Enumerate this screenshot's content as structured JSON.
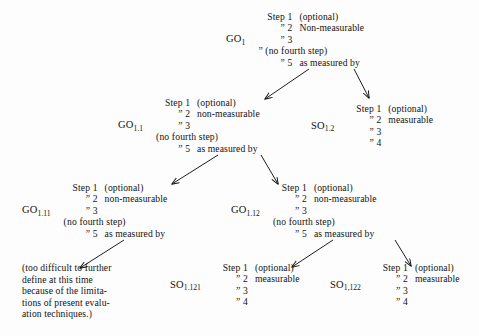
{
  "diagram": {
    "ink_color": "#111111",
    "background_color": "#fdfdfd",
    "nodes": [
      {
        "id": "GO1",
        "label_main": "GO",
        "label_sub": "1",
        "rows": [
          {
            "key": "Step 1",
            "value": "(optional)"
          },
          {
            "key": "” 2",
            "value": "Non-measurable"
          },
          {
            "key": "” 3",
            "value": ""
          },
          {
            "key": "” (no fourth step)",
            "value": ""
          },
          {
            "key": "” 5",
            "value": "as measured by"
          }
        ]
      },
      {
        "id": "GO1.1",
        "label_main": "GO",
        "label_sub": "1.1",
        "rows": [
          {
            "key": "Step 1",
            "value": "(optional)"
          },
          {
            "key": "” 2",
            "value": "non-measurable"
          },
          {
            "key": "” 3",
            "value": ""
          },
          {
            "key": "(no fourth step)",
            "value": ""
          },
          {
            "key": "” 5",
            "value": "as measured by"
          }
        ]
      },
      {
        "id": "SO1.2",
        "label_main": "SO",
        "label_sub": "1.2",
        "rows": [
          {
            "key": "Step 1",
            "value": "(optional)"
          },
          {
            "key": "” 2",
            "value": "measurable"
          },
          {
            "key": "” 3",
            "value": ""
          },
          {
            "key": "” 4",
            "value": ""
          }
        ]
      },
      {
        "id": "GO1.11",
        "label_main": "GO",
        "label_sub": "1.11",
        "rows": [
          {
            "key": "Step 1",
            "value": "(optional)"
          },
          {
            "key": "” 2",
            "value": "non-measurable"
          },
          {
            "key": "” 3",
            "value": ""
          },
          {
            "key": "(no fourth step)",
            "value": ""
          },
          {
            "key": "” 5",
            "value": "as measured by"
          }
        ]
      },
      {
        "id": "GO1.12",
        "label_main": "GO",
        "label_sub": "1.12",
        "rows": [
          {
            "key": "Step 1",
            "value": "(optional)"
          },
          {
            "key": "” 2",
            "value": "non-measurable"
          },
          {
            "key": "” 3",
            "value": ""
          },
          {
            "key": "(no fourth step)",
            "value": ""
          },
          {
            "key": "” 5",
            "value": "as measured by"
          }
        ]
      },
      {
        "id": "SO1.121",
        "label_main": "SO",
        "label_sub": "1.121",
        "rows": [
          {
            "key": "Step 1",
            "value": "(optional)"
          },
          {
            "key": "” 2",
            "value": "measurable"
          },
          {
            "key": "” 3",
            "value": ""
          },
          {
            "key": "” 4",
            "value": ""
          }
        ]
      },
      {
        "id": "SO1.122",
        "label_main": "SO",
        "label_sub": "1,122",
        "rows": [
          {
            "key": "Step 1",
            "value": "(optional)"
          },
          {
            "key": "” 2",
            "value": "measurable"
          },
          {
            "key": "” 3",
            "value": ""
          },
          {
            "key": "” 4",
            "value": ""
          }
        ]
      }
    ],
    "terminal_note": {
      "id": "terminal-note",
      "lines": [
        "(too difficult to further",
        "define at this time",
        "because of the limita-",
        "tions of present evalu-",
        "ation techniques.)"
      ]
    },
    "edges": [
      {
        "from": "GO1",
        "to": "GO1.1"
      },
      {
        "from": "GO1",
        "to": "SO1.2"
      },
      {
        "from": "GO1.1",
        "to": "GO1.11"
      },
      {
        "from": "GO1.1",
        "to": "GO1.12"
      },
      {
        "from": "GO1.11",
        "to": "terminal-note"
      },
      {
        "from": "GO1.12",
        "to": "SO1.121"
      },
      {
        "from": "GO1.12",
        "to": "SO1.122"
      }
    ]
  }
}
